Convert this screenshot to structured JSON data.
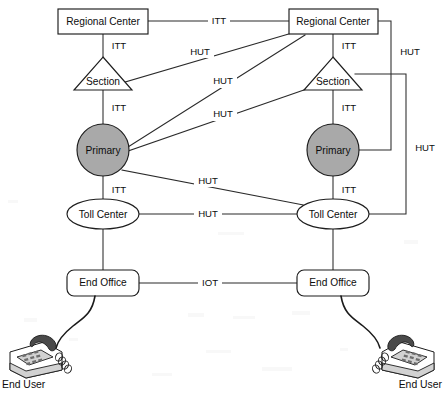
{
  "diagram": {
    "colors": {
      "line": "#2a2a2a",
      "node_stroke": "#1d1d1d",
      "primary_fill": "#a9a9a9",
      "background": "#ffffff"
    },
    "nodes": [
      {
        "id": "rc-left",
        "label": "Regional Center",
        "shape": "rect",
        "side": "left"
      },
      {
        "id": "rc-right",
        "label": "Regional Center",
        "shape": "rect",
        "side": "right"
      },
      {
        "id": "sec-left",
        "label": "Section",
        "shape": "triangle",
        "side": "left"
      },
      {
        "id": "sec-right",
        "label": "Section",
        "shape": "triangle",
        "side": "right"
      },
      {
        "id": "pri-left",
        "label": "Primary",
        "shape": "circle",
        "side": "left"
      },
      {
        "id": "pri-right",
        "label": "Primary",
        "shape": "circle",
        "side": "right"
      },
      {
        "id": "toll-left",
        "label": "Toll Center",
        "shape": "ellipse",
        "side": "left"
      },
      {
        "id": "toll-right",
        "label": "Toll Center",
        "shape": "ellipse",
        "side": "right"
      },
      {
        "id": "eo-left",
        "label": "End Office",
        "shape": "roundrect",
        "side": "left"
      },
      {
        "id": "eo-right",
        "label": "End Office",
        "shape": "roundrect",
        "side": "right"
      }
    ],
    "edge_labels": {
      "rc_to_rc": "ITT",
      "rc_left_to_sec_left": "ITT",
      "sec_left_to_pri_left": "ITT",
      "pri_left_to_toll_left": "ITT",
      "rc_right_to_sec_right": "ITT",
      "sec_right_to_pri_right": "ITT",
      "pri_right_to_toll_right": "ITT",
      "sec_left_to_rc_right": "HUT",
      "pri_left_to_rc_right": "HUT",
      "pri_left_to_sec_right": "HUT",
      "pri_left_to_toll_right": "HUT",
      "toll_to_toll": "HUT",
      "rc_right_to_pri_right": "HUT",
      "sec_right_to_toll_right": "HUT",
      "eo_to_eo": "IOT"
    },
    "endpoints": [
      {
        "id": "user-left",
        "label": "End User",
        "icon": "desk-phone-icon"
      },
      {
        "id": "user-right",
        "label": "End User",
        "icon": "desk-phone-icon"
      }
    ]
  }
}
